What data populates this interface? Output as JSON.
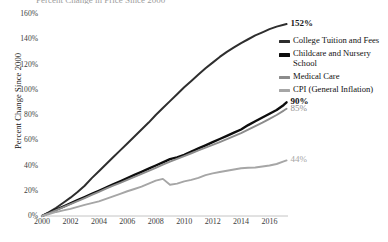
{
  "cut_off_title": "Percent Change in Price Since 2000",
  "chart_data": {
    "type": "line",
    "title": "",
    "xlabel": "",
    "ylabel": "Percent Change Since 2000",
    "xlim": [
      2000,
      2017.3
    ],
    "ylim": [
      0,
      160
    ],
    "grid": false,
    "legend_position": "right",
    "x_ticks": [
      "2000",
      "2002",
      "2004",
      "2006",
      "2008",
      "2010",
      "2012",
      "2014",
      "2016"
    ],
    "x_tick_values": [
      2000,
      2002,
      2004,
      2006,
      2008,
      2010,
      2012,
      2014,
      2016
    ],
    "y_ticks": [
      "0%",
      "20%",
      "40%",
      "60%",
      "80%",
      "100%",
      "120%",
      "140%",
      "160%"
    ],
    "y_tick_values": [
      0,
      20,
      40,
      60,
      80,
      100,
      120,
      140,
      160
    ],
    "x": [
      2000,
      2000.5,
      2001,
      2001.5,
      2002,
      2002.5,
      2003,
      2003.5,
      2004,
      2004.5,
      2005,
      2005.5,
      2006,
      2006.5,
      2007,
      2007.5,
      2008,
      2008.5,
      2009,
      2009.5,
      2010,
      2010.5,
      2011,
      2011.5,
      2012,
      2012.5,
      2013,
      2013.5,
      2014,
      2014.5,
      2015,
      2015.5,
      2016,
      2016.5,
      2017,
      2017.2
    ],
    "series": [
      {
        "name": "College Tuition and Fees",
        "color": "#2e2e2e",
        "width": 2.0,
        "end_label": "152%",
        "end_label_bold": true,
        "end_label_color": "#1a1a1a",
        "values": [
          0,
          3,
          6.5,
          10.5,
          14.5,
          19,
          24,
          30,
          35.5,
          41,
          46.5,
          52,
          57.5,
          63,
          68.5,
          74,
          80,
          85.5,
          91,
          96.5,
          102,
          107,
          112,
          117,
          121.5,
          126,
          130,
          133.5,
          137,
          140,
          143,
          145.5,
          148,
          150,
          151.5,
          152
        ]
      },
      {
        "name": "Childcare and Nursery School",
        "color": "#0d0d0d",
        "width": 2.4,
        "end_label": "90%",
        "end_label_bold": true,
        "end_label_color": "#0d0d0d",
        "values": [
          0,
          2.5,
          5,
          7.5,
          10,
          12.5,
          15,
          17.5,
          20,
          22.5,
          25,
          27.5,
          30,
          32.5,
          35,
          37.5,
          40,
          42.5,
          45,
          46.5,
          48.5,
          51,
          53.5,
          56,
          58.5,
          61,
          63.5,
          66,
          68.5,
          72,
          75,
          78,
          81,
          84,
          88,
          90
        ]
      },
      {
        "name": "Medical Care",
        "color": "#8c8c8c",
        "width": 1.9,
        "end_label": "85%",
        "end_label_bold": false,
        "end_label_color": "#8c8c8c",
        "values": [
          0,
          2.2,
          4.6,
          7,
          9.4,
          11.8,
          14.2,
          16.7,
          19.2,
          21.6,
          24,
          26.3,
          28.6,
          31,
          33.4,
          35.8,
          38.2,
          40.6,
          43,
          45.2,
          47.4,
          49.7,
          52,
          54.2,
          56.4,
          58.6,
          60.8,
          63.2,
          65.6,
          68.4,
          71.2,
          74,
          77,
          80,
          83.5,
          85
        ]
      },
      {
        "name": "CPI (General Inflation)",
        "color": "#a6a6a6",
        "width": 1.9,
        "end_label": "44%",
        "end_label_bold": false,
        "end_label_color": "#a6a6a6",
        "values": [
          0,
          1.6,
          3.2,
          4.4,
          5.6,
          7.2,
          8.8,
          10.2,
          11.6,
          13.6,
          15.6,
          17.6,
          19.6,
          21.4,
          23.2,
          25.6,
          28,
          29.4,
          24.8,
          25.6,
          27.4,
          28.6,
          30.2,
          32.4,
          33.8,
          34.8,
          35.8,
          36.8,
          37.8,
          38.2,
          38.4,
          39.2,
          40,
          41.2,
          43.2,
          44
        ]
      }
    ]
  },
  "legend": {
    "items": [
      {
        "label": "College Tuition and Fees",
        "color": "#2e2e2e"
      },
      {
        "label": "Childcare and Nursery School",
        "color": "#0d0d0d"
      },
      {
        "label": "Medical Care",
        "color": "#8c8c8c"
      },
      {
        "label": "CPI (General Inflation)",
        "color": "#a6a6a6"
      }
    ]
  }
}
